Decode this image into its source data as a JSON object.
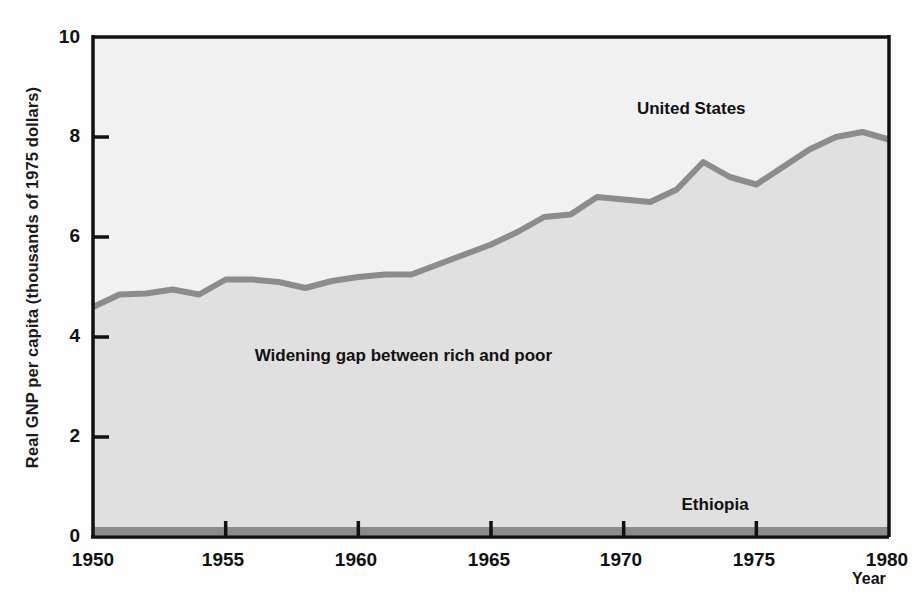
{
  "chart_data": {
    "type": "area",
    "title": "",
    "xlabel": "Year",
    "ylabel": "Real GNP per capita (thousands of 1975 dollars)",
    "xlim": [
      1950,
      1980
    ],
    "ylim": [
      0,
      10
    ],
    "grid": false,
    "legend_position": "inline-annotations",
    "x": [
      1950,
      1951,
      1952,
      1953,
      1954,
      1955,
      1956,
      1957,
      1958,
      1959,
      1960,
      1961,
      1962,
      1963,
      1964,
      1965,
      1966,
      1967,
      1968,
      1969,
      1970,
      1971,
      1972,
      1973,
      1974,
      1975,
      1976,
      1977,
      1978,
      1979,
      1980
    ],
    "xticks": [
      1950,
      1955,
      1960,
      1965,
      1970,
      1975,
      1980
    ],
    "xtick_labels": [
      "1950",
      "1955",
      "1960",
      "1965",
      "1970",
      "1975",
      "1980"
    ],
    "yticks": [
      0,
      2,
      4,
      6,
      8,
      10
    ],
    "ytick_labels": [
      "0",
      "2",
      "4",
      "6",
      "8",
      "10"
    ],
    "series": [
      {
        "name": "United States",
        "label": "United States",
        "color": "#8c8c8c",
        "values": [
          4.6,
          4.85,
          4.87,
          4.95,
          4.85,
          5.15,
          5.15,
          5.1,
          4.98,
          5.12,
          5.2,
          5.25,
          5.25,
          5.45,
          5.65,
          5.85,
          6.1,
          6.4,
          6.45,
          6.8,
          6.75,
          6.7,
          6.95,
          7.5,
          7.2,
          7.05,
          7.4,
          7.75,
          8.0,
          8.1,
          7.95
        ]
      },
      {
        "name": "Ethiopia",
        "label": "Ethiopia",
        "color": "#8c8c8c",
        "values": [
          0.12,
          0.12,
          0.12,
          0.12,
          0.12,
          0.12,
          0.12,
          0.12,
          0.12,
          0.12,
          0.12,
          0.12,
          0.12,
          0.12,
          0.12,
          0.12,
          0.12,
          0.12,
          0.12,
          0.12,
          0.12,
          0.12,
          0.12,
          0.12,
          0.12,
          0.12,
          0.12,
          0.12,
          0.12,
          0.12,
          0.12
        ]
      }
    ],
    "annotations": [
      {
        "text": "Widening gap between rich and poor",
        "x": 1962.5,
        "y": 3.6
      }
    ],
    "series_label_positions": [
      {
        "name": "United States",
        "x": 1970.5,
        "y": 8.55
      },
      {
        "name": "Ethiopia",
        "x": 1973.5,
        "y": 0.62
      }
    ],
    "colors": {
      "line": "#8c8c8c",
      "fill_below": "#e0e0e0",
      "fill_above": "#f1f1f1",
      "axis": "#111111",
      "text": "#111111",
      "background": "#fdfdfd"
    }
  },
  "axis": {
    "ylabel": "Real GNP per capita (thousands of 1975 dollars)",
    "xlabel": "Year",
    "ytick_0": "0",
    "ytick_2": "2",
    "ytick_4": "4",
    "ytick_6": "6",
    "ytick_8": "8",
    "ytick_10": "10",
    "xtick_1950": "1950",
    "xtick_1955": "1955",
    "xtick_1960": "1960",
    "xtick_1965": "1965",
    "xtick_1970": "1970",
    "xtick_1975": "1975",
    "xtick_1980": "1980"
  },
  "labels": {
    "united_states": "United States",
    "ethiopia": "Ethiopia",
    "gap_note": "Widening gap between rich and poor"
  }
}
